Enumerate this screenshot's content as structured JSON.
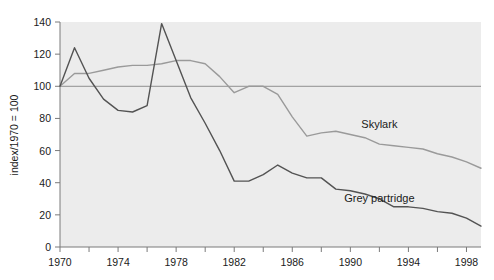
{
  "chart_data": {
    "type": "line",
    "title": "",
    "xlabel": "",
    "ylabel": "index/1970 = 100",
    "xlim": [
      1970,
      1999
    ],
    "ylim": [
      0,
      140
    ],
    "grid": false,
    "legend_position": "inline-annotation",
    "x_ticks_major": [
      1970,
      1974,
      1978,
      1982,
      1986,
      1990,
      1994,
      1998
    ],
    "x_ticks_minor": [
      1972,
      1976,
      1980,
      1984,
      1988,
      1992,
      1996
    ],
    "y_ticks": [
      0,
      20,
      40,
      60,
      80,
      100,
      120,
      140
    ],
    "reference_line": 100,
    "x": [
      1970,
      1971,
      1972,
      1973,
      1974,
      1975,
      1976,
      1977,
      1978,
      1979,
      1980,
      1981,
      1982,
      1983,
      1984,
      1985,
      1986,
      1987,
      1988,
      1989,
      1990,
      1991,
      1992,
      1993,
      1994,
      1995,
      1996,
      1997,
      1998,
      1999
    ],
    "series": [
      {
        "name": "Skylark",
        "color": "#9a9a9a",
        "values": [
          100,
          108,
          108,
          110,
          112,
          113,
          113,
          114,
          116,
          116,
          114,
          106,
          96,
          100,
          100,
          95,
          81,
          69,
          71,
          72,
          70,
          68,
          64,
          63,
          62,
          61,
          58,
          56,
          53,
          49
        ]
      },
      {
        "name": "Grey partridge",
        "color": "#535353",
        "values": [
          100,
          124,
          105,
          92,
          85,
          84,
          88,
          139,
          116,
          93,
          77,
          60,
          41,
          41,
          45,
          51,
          46,
          43,
          43,
          36,
          35,
          33,
          30,
          25,
          25,
          24,
          22,
          21,
          18,
          13
        ]
      }
    ],
    "annotations": [
      {
        "text": "Skylark",
        "x": 1992,
        "y": 74
      },
      {
        "text": "Grey partridge",
        "x": 1992,
        "y": 28
      }
    ],
    "colors": {
      "plot_background": "#ececec",
      "page_background": "#ffffff",
      "axis": "#7a7a7a",
      "reference_line": "#8f8f8f",
      "text": "#1a1a1a"
    }
  }
}
